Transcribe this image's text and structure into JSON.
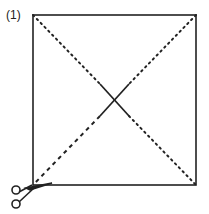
{
  "diagram": {
    "step_label": "(1)",
    "colors": {
      "line": "#222222",
      "background": "#ffffff"
    },
    "icons": [
      "scissors-icon"
    ]
  }
}
